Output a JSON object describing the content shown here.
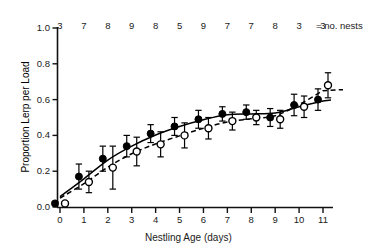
{
  "chart_data": {
    "type": "scatter",
    "title": "",
    "xlabel": "Nestling Age (days)",
    "ylabel": "Proportion Lerp per Load",
    "xlim": [
      -0.5,
      11.7
    ],
    "ylim": [
      0.0,
      1.0
    ],
    "xticks": [
      0,
      1,
      2,
      3,
      4,
      5,
      6,
      7,
      8,
      9,
      10,
      11
    ],
    "xtick_labels": [
      "0",
      "1",
      "2",
      "3",
      "4",
      "5",
      "6",
      "7",
      "8",
      "9",
      "10",
      "11"
    ],
    "yticks": [
      0.0,
      0.2,
      0.4,
      0.6,
      0.8,
      1.0
    ],
    "ytick_labels": [
      "0.0",
      "0.2",
      "0.4",
      "0.6",
      "0.8",
      "1.0"
    ],
    "grid": false,
    "legend_position": "top-right",
    "x": [
      0,
      1,
      2,
      3,
      4,
      5,
      6,
      7,
      8,
      9,
      10,
      11
    ],
    "series": [
      {
        "name": "filled-circles",
        "marker": "filled circle",
        "line": "solid fitted curve",
        "values": [
          0.02,
          0.17,
          0.27,
          0.34,
          0.41,
          0.45,
          0.49,
          0.52,
          0.53,
          0.5,
          0.57,
          0.6
        ],
        "errors": [
          0.01,
          0.07,
          0.07,
          0.06,
          0.05,
          0.05,
          0.05,
          0.04,
          0.04,
          0.05,
          0.06,
          0.06
        ]
      },
      {
        "name": "open-circles",
        "marker": "open circle",
        "line": "dashed fitted curve",
        "values": [
          0.02,
          0.14,
          0.22,
          0.31,
          0.35,
          0.4,
          0.44,
          0.48,
          0.5,
          0.49,
          0.56,
          0.68
        ],
        "errors": [
          0.01,
          0.06,
          0.12,
          0.08,
          0.07,
          0.07,
          0.06,
          0.05,
          0.04,
          0.05,
          0.06,
          0.07
        ]
      }
    ],
    "annotations": {
      "nest_counts": [
        3,
        7,
        8,
        9,
        8,
        5,
        9,
        7,
        7,
        8,
        3,
        3
      ],
      "nest_counts_label": "= no. nests"
    }
  },
  "axes": {
    "ylabel": "Proportion Lerp per Load",
    "xlabel": "Nestling Age (days)",
    "ytick_labels": [
      "1.0",
      "0.8",
      "0.6",
      "0.4",
      "0.2",
      "0.0"
    ],
    "xtick_labels": [
      "0",
      "1",
      "2",
      "3",
      "4",
      "5",
      "6",
      "7",
      "8",
      "9",
      "10",
      "11"
    ]
  },
  "legend": {
    "nest_label": "= no. nests"
  },
  "colors": {
    "axis": "#111111",
    "marker_filled": "#000000",
    "marker_open": "#ffffff",
    "marker_edge": "#000000",
    "curve_solid": "#000000",
    "curve_dashed": "#000000",
    "background": "#ffffff"
  }
}
